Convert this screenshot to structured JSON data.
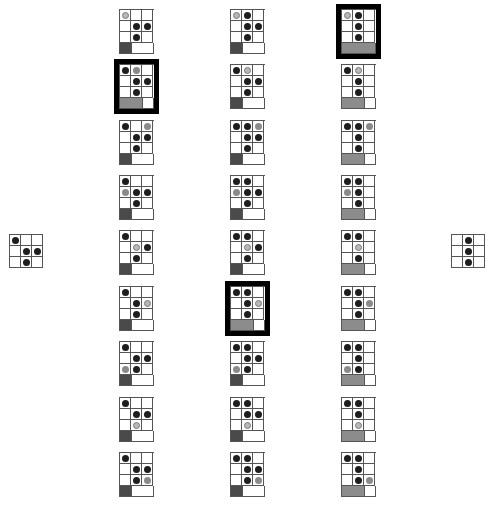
{
  "legend": {
    "b": "black stone",
    "g": "gray stone",
    "r": "gray ring (selected)",
    "": "empty"
  },
  "colors": {
    "stone_black": "#1e1e1e",
    "stone_gray": "#8a8a8a",
    "bar_dark": "#4a4a4a",
    "bar_light": "#8c8c8c",
    "thick_border": "#000000"
  },
  "left_board": {
    "x": 9,
    "y": 234,
    "cells": [
      [
        "b",
        "",
        ""
      ],
      [
        "",
        "b",
        "b"
      ],
      [
        "",
        "b",
        ""
      ]
    ]
  },
  "right_board": {
    "x": 451,
    "y": 234,
    "cells": [
      [
        "",
        "b",
        ""
      ],
      [
        "",
        "b",
        ""
      ],
      [
        "",
        "b",
        ""
      ]
    ]
  },
  "columns": [
    {
      "x": 119,
      "boards": [
        {
          "cells": [
            [
              "r",
              "",
              ""
            ],
            [
              "",
              "b",
              "b"
            ],
            [
              "",
              "b",
              ""
            ]
          ],
          "bar": 1,
          "thick": false
        },
        {
          "cells": [
            [
              "b",
              "g",
              ""
            ],
            [
              "",
              "b",
              "b"
            ],
            [
              "",
              "b",
              ""
            ]
          ],
          "bar": 2,
          "thick": true
        },
        {
          "cells": [
            [
              "b",
              "",
              "g"
            ],
            [
              "",
              "b",
              "b"
            ],
            [
              "",
              "b",
              ""
            ]
          ],
          "bar": 1,
          "thick": false
        },
        {
          "cells": [
            [
              "b",
              "",
              ""
            ],
            [
              "g",
              "b",
              "b"
            ],
            [
              "",
              "b",
              ""
            ]
          ],
          "bar": 1,
          "thick": false
        },
        {
          "cells": [
            [
              "b",
              "",
              ""
            ],
            [
              "",
              "r",
              "b"
            ],
            [
              "",
              "b",
              ""
            ]
          ],
          "bar": 1,
          "thick": false
        },
        {
          "cells": [
            [
              "b",
              "",
              ""
            ],
            [
              "",
              "b",
              "r"
            ],
            [
              "",
              "b",
              ""
            ]
          ],
          "bar": 1,
          "thick": false
        },
        {
          "cells": [
            [
              "b",
              "",
              ""
            ],
            [
              "",
              "b",
              "b"
            ],
            [
              "g",
              "b",
              ""
            ]
          ],
          "bar": 1,
          "thick": false
        },
        {
          "cells": [
            [
              "b",
              "",
              ""
            ],
            [
              "",
              "b",
              "b"
            ],
            [
              "",
              "r",
              ""
            ]
          ],
          "bar": 1,
          "thick": false
        },
        {
          "cells": [
            [
              "b",
              "",
              ""
            ],
            [
              "",
              "b",
              "b"
            ],
            [
              "",
              "b",
              "g"
            ]
          ],
          "bar": 1,
          "thick": false
        }
      ]
    },
    {
      "x": 230,
      "boards": [
        {
          "cells": [
            [
              "r",
              "b",
              ""
            ],
            [
              "",
              "b",
              "b"
            ],
            [
              "",
              "b",
              ""
            ]
          ],
          "bar": 1,
          "thick": false
        },
        {
          "cells": [
            [
              "b",
              "r",
              ""
            ],
            [
              "",
              "b",
              "b"
            ],
            [
              "",
              "b",
              ""
            ]
          ],
          "bar": 1,
          "thick": false
        },
        {
          "cells": [
            [
              "b",
              "b",
              "g"
            ],
            [
              "",
              "b",
              "b"
            ],
            [
              "",
              "b",
              ""
            ]
          ],
          "bar": 1,
          "thick": false
        },
        {
          "cells": [
            [
              "b",
              "b",
              ""
            ],
            [
              "g",
              "b",
              "b"
            ],
            [
              "",
              "b",
              ""
            ]
          ],
          "bar": 1,
          "thick": false
        },
        {
          "cells": [
            [
              "b",
              "b",
              ""
            ],
            [
              "",
              "r",
              "b"
            ],
            [
              "",
              "b",
              ""
            ]
          ],
          "bar": 1,
          "thick": false
        },
        {
          "cells": [
            [
              "b",
              "b",
              ""
            ],
            [
              "",
              "b",
              "r"
            ],
            [
              "",
              "b",
              ""
            ]
          ],
          "bar": 2,
          "thick": true
        },
        {
          "cells": [
            [
              "b",
              "b",
              ""
            ],
            [
              "",
              "b",
              "b"
            ],
            [
              "g",
              "b",
              ""
            ]
          ],
          "bar": 1,
          "thick": false
        },
        {
          "cells": [
            [
              "b",
              "b",
              ""
            ],
            [
              "",
              "b",
              "b"
            ],
            [
              "",
              "r",
              ""
            ]
          ],
          "bar": 1,
          "thick": false
        },
        {
          "cells": [
            [
              "b",
              "b",
              ""
            ],
            [
              "",
              "b",
              "b"
            ],
            [
              "",
              "b",
              "g"
            ]
          ],
          "bar": 1,
          "thick": false
        }
      ]
    },
    {
      "x": 341,
      "boards": [
        {
          "cells": [
            [
              "r",
              "b",
              ""
            ],
            [
              "",
              "b",
              ""
            ],
            [
              "",
              "b",
              ""
            ]
          ],
          "bar": 3,
          "thick": true
        },
        {
          "cells": [
            [
              "b",
              "r",
              ""
            ],
            [
              "",
              "b",
              ""
            ],
            [
              "",
              "b",
              ""
            ]
          ],
          "bar": 2,
          "thick": false
        },
        {
          "cells": [
            [
              "b",
              "b",
              "g"
            ],
            [
              "",
              "b",
              ""
            ],
            [
              "",
              "b",
              ""
            ]
          ],
          "bar": 2,
          "thick": false
        },
        {
          "cells": [
            [
              "b",
              "b",
              ""
            ],
            [
              "g",
              "b",
              ""
            ],
            [
              "",
              "b",
              ""
            ]
          ],
          "bar": 2,
          "thick": false
        },
        {
          "cells": [
            [
              "b",
              "b",
              ""
            ],
            [
              "",
              "r",
              ""
            ],
            [
              "",
              "b",
              ""
            ]
          ],
          "bar": 2,
          "thick": false
        },
        {
          "cells": [
            [
              "b",
              "b",
              ""
            ],
            [
              "",
              "b",
              "g"
            ],
            [
              "",
              "b",
              ""
            ]
          ],
          "bar": 2,
          "thick": false
        },
        {
          "cells": [
            [
              "b",
              "b",
              ""
            ],
            [
              "",
              "b",
              ""
            ],
            [
              "g",
              "b",
              ""
            ]
          ],
          "bar": 2,
          "thick": false
        },
        {
          "cells": [
            [
              "b",
              "b",
              ""
            ],
            [
              "",
              "b",
              ""
            ],
            [
              "",
              "r",
              ""
            ]
          ],
          "bar": 2,
          "thick": false
        },
        {
          "cells": [
            [
              "b",
              "b",
              ""
            ],
            [
              "",
              "b",
              ""
            ],
            [
              "",
              "b",
              "g"
            ]
          ],
          "bar": 2,
          "thick": false
        }
      ]
    }
  ],
  "row_y": [
    9,
    64,
    120,
    175,
    230,
    286,
    341,
    397,
    452
  ]
}
